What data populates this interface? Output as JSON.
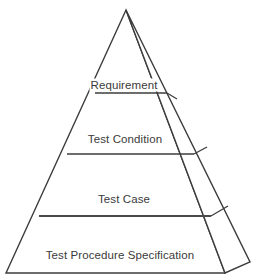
{
  "diagram": {
    "type": "pyramid",
    "orientation": "3d-right-face",
    "background_color": "#ffffff",
    "stroke_color": "#3c3c3c",
    "text_color": "#3a3a3a",
    "apex": {
      "x": 126,
      "y": 10
    },
    "base_left": {
      "x": 6,
      "y": 273
    },
    "base_front_right": {
      "x": 225,
      "y": 273
    },
    "base_back_right": {
      "x": 250,
      "y": 262
    },
    "tiers": [
      {
        "index": 1,
        "label": "Requirement",
        "label_x": 124,
        "label_y": 85,
        "divider_y": 93,
        "divider_left_x": 95,
        "divider_right_x": 167,
        "side_tick_x": 177,
        "side_tick_y": 99,
        "label_overlaps_edges": true
      },
      {
        "index": 2,
        "label": "Test Condition",
        "label_x": 125,
        "label_y": 139,
        "divider_y": 154,
        "divider_left_x": 67,
        "divider_right_x": 194,
        "side_tick_x": 207,
        "side_tick_y": 147,
        "label_overlaps_edges": false
      },
      {
        "index": 3,
        "label": "Test Case",
        "label_x": 124,
        "label_y": 199,
        "divider_y": 216,
        "divider_left_x": 39,
        "divider_right_x": 211,
        "side_tick_x": 228,
        "side_tick_y": 206,
        "label_overlaps_edges": false
      },
      {
        "index": 4,
        "label": "Test Procedure Specification",
        "label_x": 120,
        "label_y": 255,
        "divider_y": 273,
        "divider_left_x": 6,
        "divider_right_x": 225,
        "side_tick_x": 250,
        "side_tick_y": 262,
        "label_overlaps_edges": false
      }
    ],
    "caption_fragment": "···"
  }
}
